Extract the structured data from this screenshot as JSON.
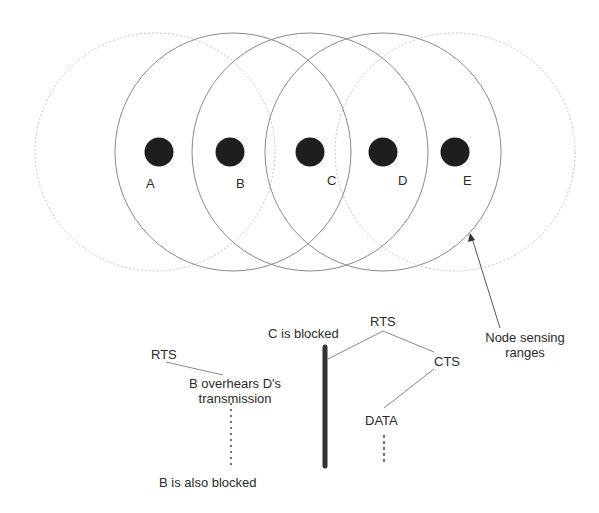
{
  "nodes": [
    {
      "id": "A",
      "label": "A",
      "cx": 159,
      "cy": 152
    },
    {
      "id": "B",
      "label": "B",
      "cx": 230,
      "cy": 152
    },
    {
      "id": "C",
      "label": "C",
      "cx": 310,
      "cy": 152
    },
    {
      "id": "D",
      "label": "D",
      "cx": 383,
      "cy": 152
    },
    {
      "id": "E",
      "label": "E",
      "cx": 455,
      "cy": 152
    }
  ],
  "ranges": [
    {
      "node": "A",
      "style": "dotted"
    },
    {
      "node": "B",
      "style": "solid"
    },
    {
      "node": "C",
      "style": "solid"
    },
    {
      "node": "D",
      "style": "solid"
    },
    {
      "node": "E",
      "style": "dotted"
    }
  ],
  "annotations": {
    "sensing_label_line1": "Node sensing",
    "sensing_label_line2": "ranges",
    "c_blocked": "C is blocked",
    "rts_d": "RTS",
    "cts_e": "CTS",
    "data_d": "DATA",
    "rts_b": "RTS",
    "b_overhears_line1": "B overhears D's",
    "b_overhears_line2": "transmission",
    "b_blocked": "B is also blocked"
  },
  "colors": {
    "node_fill": "#1e1e1e",
    "solid_circle": "#8a8a8a",
    "dotted_circle": "#bdbdbd",
    "text": "#2a2a2a"
  }
}
